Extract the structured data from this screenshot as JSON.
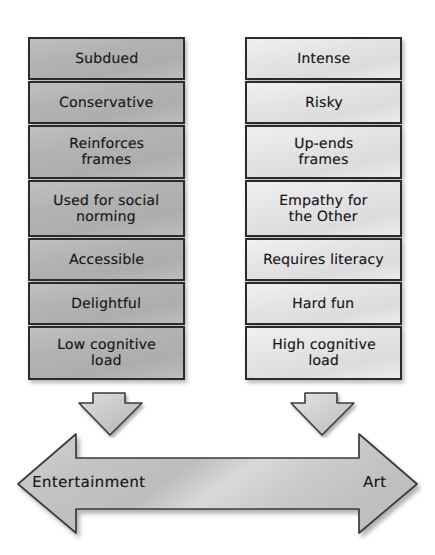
{
  "diagram": {
    "title_visible": false,
    "type": "two-column-spectrum-comparison",
    "colors": {
      "left_column_fill": "#b3b3b3",
      "right_column_fill": "#e4e4e4",
      "outline": "#2b2b2b",
      "arrow_fill": "#cfcfcf",
      "text": "#18181a",
      "background": "#ffffff"
    },
    "left_column": {
      "pole_label": "Entertainment",
      "items": [
        {
          "label": "Subdued"
        },
        {
          "label": "Conservative"
        },
        {
          "label": "Reinforces\nframes"
        },
        {
          "label": "Used for social\nnorming"
        },
        {
          "label": "Accessible"
        },
        {
          "label": "Delightful"
        },
        {
          "label": "Low cognitive\nload"
        }
      ]
    },
    "right_column": {
      "pole_label": "Art",
      "items": [
        {
          "label": "Intense"
        },
        {
          "label": "Risky"
        },
        {
          "label": "Up-ends\nframes"
        },
        {
          "label": "Empathy for\nthe Other"
        },
        {
          "label": "Requires literacy"
        },
        {
          "label": "Hard fun"
        },
        {
          "label": "High cognitive\nload"
        }
      ]
    },
    "spectrum": {
      "left_end_label": "Entertainment",
      "right_end_label": "Art",
      "double_headed": true
    },
    "connectors": [
      {
        "name": "left-column-down-arrow",
        "direction": "down"
      },
      {
        "name": "right-column-down-arrow",
        "direction": "down"
      }
    ]
  }
}
